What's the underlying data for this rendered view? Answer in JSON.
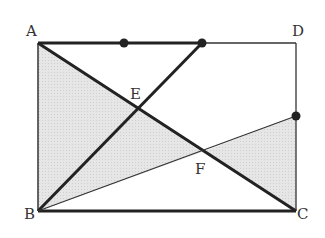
{
  "diagram": {
    "type": "geometry",
    "shape": "rectangle ABCD",
    "points": {
      "A": {
        "label": "A",
        "x": 38,
        "y": 43
      },
      "B": {
        "label": "B",
        "x": 38,
        "y": 211
      },
      "C": {
        "label": "C",
        "x": 296,
        "y": 211
      },
      "D": {
        "label": "D",
        "x": 296,
        "y": 43
      },
      "E": {
        "label": "E",
        "x": 137,
        "y": 109
      },
      "F": {
        "label": "F",
        "x": 202,
        "y": 152
      }
    },
    "marked_points": [
      {
        "name": "point-on-AD-1",
        "x": 124,
        "y": 43
      },
      {
        "name": "point-on-AD-2",
        "x": 202,
        "y": 43
      },
      {
        "name": "point-on-DC",
        "x": 296,
        "y": 116
      }
    ],
    "segments": [
      {
        "name": "AD-thick",
        "from": "A",
        "to": "point-on-AD-2",
        "weight": "thick"
      },
      {
        "name": "AD-thin",
        "from": "point-on-AD-2",
        "to": "D",
        "weight": "thin"
      },
      {
        "name": "DC",
        "from": "D",
        "to": "C",
        "weight": "thin"
      },
      {
        "name": "AB",
        "from": "A",
        "to": "B",
        "weight": "thin"
      },
      {
        "name": "BC",
        "from": "B",
        "to": "C",
        "weight": "thick"
      },
      {
        "name": "AC",
        "from": "A",
        "to": "C",
        "weight": "thick"
      },
      {
        "name": "B-to-AD-point",
        "from": "B",
        "to": "point-on-AD-2",
        "weight": "thick"
      },
      {
        "name": "B-to-DC-point",
        "from": "B",
        "to": "point-on-DC",
        "weight": "thin"
      }
    ],
    "shaded_regions": [
      "triangle ABF",
      "triangle FGC (G on DC)"
    ],
    "colors": {
      "stroke": "#222222",
      "shade": "#e2e2e2",
      "label": "#333333"
    }
  }
}
